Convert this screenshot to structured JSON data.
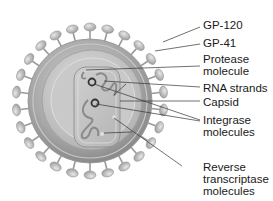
{
  "diagram": {
    "labels": [
      {
        "id": "gp120",
        "text": "GP-120",
        "lines": [
          "GP-120"
        ]
      },
      {
        "id": "gp41",
        "text": "GP-41",
        "lines": [
          "GP-41"
        ]
      },
      {
        "id": "protease",
        "text": "Protease molecule",
        "lines": [
          "Protease",
          "molecule"
        ]
      },
      {
        "id": "rna",
        "text": "RNA strands",
        "lines": [
          "RNA strands"
        ]
      },
      {
        "id": "capsid",
        "text": "Capsid",
        "lines": [
          "Capsid"
        ]
      },
      {
        "id": "integrase",
        "text": "Integrase molecules",
        "lines": [
          "Integrase",
          "molecules"
        ]
      },
      {
        "id": "rt",
        "text": "Reverse transcriptase molecules",
        "lines": [
          "Reverse",
          "transcriptase",
          "molecules"
        ]
      }
    ],
    "colors": {
      "background": "#ffffff",
      "envelope": "#b5b5b5",
      "spike": "#c4c4c4",
      "leader_line": "#333333",
      "text": "#1a1a1a"
    }
  }
}
